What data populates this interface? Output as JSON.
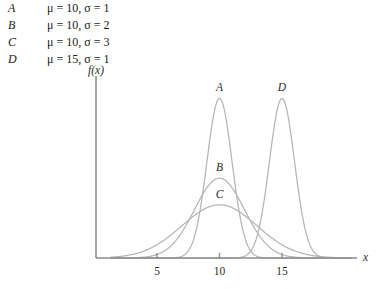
{
  "legend": {
    "rows": [
      {
        "key": "A",
        "params": "μ = 10, σ = 1"
      },
      {
        "key": "B",
        "params": "μ = 10, σ = 2"
      },
      {
        "key": "C",
        "params": "μ = 10, σ = 3"
      },
      {
        "key": "D",
        "params": "μ = 15, σ = 1"
      }
    ]
  },
  "chart_data": {
    "type": "line",
    "title": "",
    "xlabel": "x",
    "ylabel": "f(x)",
    "xlim": [
      1.3,
      20.5
    ],
    "ylim": [
      0,
      0.43
    ],
    "grid": false,
    "legend_position": "above-plot-left",
    "xticks": [
      5,
      10,
      15
    ],
    "xtick_labels": [
      "5",
      "10",
      "15"
    ],
    "yticks": [],
    "ytick_labels": [],
    "curve_color": "#b5b5b5",
    "axis_color": "#8c8c8c",
    "series": [
      {
        "name": "A",
        "distribution": "normal",
        "mu": 10,
        "sigma": 1,
        "peak_y": 0.3989,
        "label": "A",
        "label_x": 10,
        "label_anchor": "peak-above"
      },
      {
        "name": "B",
        "distribution": "normal",
        "mu": 10,
        "sigma": 2,
        "peak_y": 0.1995,
        "label": "B",
        "label_x": 10,
        "label_anchor": "peak-above"
      },
      {
        "name": "C",
        "distribution": "normal",
        "mu": 10,
        "sigma": 3,
        "peak_y": 0.133,
        "label": "C",
        "label_x": 10,
        "label_anchor": "peak-above"
      },
      {
        "name": "D",
        "distribution": "normal",
        "mu": 15,
        "sigma": 1,
        "peak_y": 0.3989,
        "label": "D",
        "label_x": 15,
        "label_anchor": "peak-above"
      }
    ],
    "annotations": [
      {
        "text": "A",
        "x": 10,
        "y": 0.3989
      },
      {
        "text": "B",
        "x": 10,
        "y": 0.1995
      },
      {
        "text": "C",
        "x": 10,
        "y": 0.133
      },
      {
        "text": "D",
        "x": 15,
        "y": 0.3989
      }
    ]
  }
}
